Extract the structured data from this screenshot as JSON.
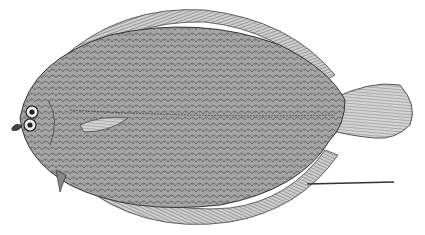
{
  "image": {
    "subject": "flatfish illustration",
    "description": "Engraved scientific illustration of a flatfish (flounder/sole) viewed from the eyed side, with scale bar",
    "colors": {
      "background": "#ffffff",
      "ink": "#3a3a3a",
      "body_fill": "#9a9a9a",
      "fin_fill": "#b8b8b8"
    },
    "scale_bar": {
      "x1": 307,
      "y1": 184,
      "x2": 394,
      "y2": 182
    }
  }
}
